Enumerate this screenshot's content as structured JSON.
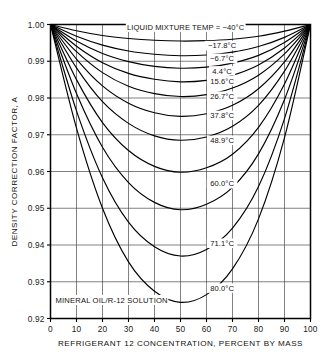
{
  "chart_data": {
    "type": "line",
    "title": "",
    "xlabel": "REFRIGERANT 12 CONCENTRATION, PERCENT BY MASS",
    "ylabel": "DENSITY CORRECTION FACTOR, A",
    "xlim": [
      0,
      100
    ],
    "ylim": [
      0.92,
      1.0
    ],
    "grid": true,
    "legend_position": "inline-curve-labels",
    "annotation": "MINERAL OIL/R-12 SOLUTION",
    "header_label": "LIQUID MIXTURE TEMP = −40°C",
    "xticks": [
      0,
      10,
      20,
      30,
      40,
      50,
      60,
      70,
      80,
      90,
      100
    ],
    "xtick_labels": [
      "0",
      "10",
      "20",
      "30",
      "40",
      "50",
      "60",
      "70",
      "80",
      "90",
      "100"
    ],
    "yticks": [
      0.92,
      0.93,
      0.94,
      0.95,
      0.96,
      0.97,
      0.98,
      0.99,
      1.0
    ],
    "ytick_labels": [
      "0.92",
      "0.93",
      "0.94",
      "0.95",
      "0.96",
      "0.97",
      "0.98",
      "0.99",
      "1.00"
    ],
    "x": [
      0,
      10,
      20,
      30,
      40,
      50,
      60,
      70,
      80,
      90,
      100
    ],
    "series": [
      {
        "name": "−40°C",
        "label": "LIQUID MIXTURE TEMP = −40°C",
        "label_x": 52,
        "label_y": 0.9988,
        "values": [
          1.0,
          0.9983,
          0.997,
          0.9962,
          0.9957,
          0.9955,
          0.9956,
          0.996,
          0.9968,
          0.9982,
          1.0
        ]
      },
      {
        "name": "−17.8°C",
        "label": "−17.8°C",
        "label_x": 66,
        "label_y": 0.9938,
        "values": [
          1.0,
          0.9968,
          0.9944,
          0.9928,
          0.9919,
          0.9915,
          0.9917,
          0.9925,
          0.994,
          0.9965,
          1.0
        ]
      },
      {
        "name": "−6.7°C",
        "label": "−6.7°C",
        "label_x": 66,
        "label_y": 0.9903,
        "values": [
          1.0,
          0.9955,
          0.9921,
          0.9899,
          0.9886,
          0.9881,
          0.9884,
          0.9895,
          0.9916,
          0.9951,
          1.0
        ]
      },
      {
        "name": "4.4°C",
        "label": "4.4°C",
        "label_x": 66,
        "label_y": 0.9869,
        "values": [
          1.0,
          0.9941,
          0.9896,
          0.9867,
          0.9851,
          0.9844,
          0.9848,
          0.9862,
          0.989,
          0.9936,
          1.0
        ]
      },
      {
        "name": "15.6°C",
        "label": "15.6°C",
        "label_x": 66,
        "label_y": 0.9842,
        "values": [
          1.0,
          0.9926,
          0.9869,
          0.9832,
          0.9812,
          0.9804,
          0.9809,
          0.9827,
          0.9862,
          0.992,
          1.0
        ]
      },
      {
        "name": "26.7°C",
        "label": "26.7°C",
        "label_x": 66,
        "label_y": 0.98,
        "values": [
          1.0,
          0.9906,
          0.9833,
          0.9786,
          0.976,
          0.975,
          0.9757,
          0.978,
          0.9825,
          0.9898,
          1.0
        ]
      },
      {
        "name": "37.8°C",
        "label": "37.8°C",
        "label_x": 66,
        "label_y": 0.9748,
        "values": [
          1.0,
          0.9882,
          0.979,
          0.9731,
          0.9697,
          0.9685,
          0.9694,
          0.9723,
          0.978,
          0.9873,
          1.0
        ]
      },
      {
        "name": "48.9°C",
        "label": "48.9°C",
        "label_x": 66,
        "label_y": 0.968,
        "values": [
          1.0,
          0.985,
          0.9733,
          0.9657,
          0.9614,
          0.9598,
          0.961,
          0.9647,
          0.972,
          0.9838,
          1.0
        ]
      },
      {
        "name": "60.0°C",
        "label": "60.0°C",
        "label_x": 66,
        "label_y": 0.9562,
        "values": [
          1.0,
          0.9812,
          0.9666,
          0.957,
          0.9516,
          0.9496,
          0.9511,
          0.9557,
          0.9648,
          0.9796,
          1.0
        ]
      },
      {
        "name": "71.1°C",
        "label": "71.1°C",
        "label_x": 66,
        "label_y": 0.94,
        "values": [
          1.0,
          0.9765,
          0.9583,
          0.9462,
          0.9395,
          0.937,
          0.9388,
          0.9446,
          0.9559,
          0.9744,
          1.0
        ]
      },
      {
        "name": "80.0°C",
        "label": "80.0°C",
        "label_x": 66,
        "label_y": 0.9278,
        "values": [
          1.0,
          0.9718,
          0.95,
          0.9354,
          0.9274,
          0.9244,
          0.9265,
          0.9335,
          0.9471,
          0.9692,
          1.0
        ]
      }
    ]
  }
}
